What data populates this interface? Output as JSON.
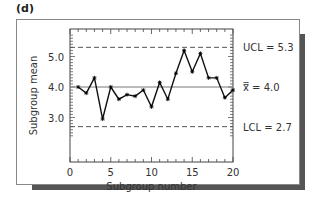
{
  "panel_label": "(d)",
  "chart_data": {
    "type": "line",
    "title": "",
    "xlabel": "Subgroup number",
    "ylabel": "Subgroup mean",
    "x": [
      1,
      2,
      3,
      4,
      5,
      6,
      7,
      8,
      9,
      10,
      11,
      12,
      13,
      14,
      15,
      16,
      17,
      18,
      19,
      20
    ],
    "series": [
      {
        "name": "Subgroup mean",
        "values": [
          4.0,
          3.8,
          4.3,
          2.95,
          4.0,
          3.6,
          3.75,
          3.7,
          3.9,
          3.35,
          4.15,
          3.6,
          4.45,
          5.2,
          4.5,
          5.1,
          4.3,
          4.3,
          3.65,
          3.9
        ]
      }
    ],
    "xlim": [
      0,
      20
    ],
    "ylim": [
      2.4,
      5.75
    ],
    "xticks": [
      0,
      5,
      10,
      15,
      20
    ],
    "xtick_labels": [
      "0",
      "5",
      "10",
      "15",
      "20"
    ],
    "yticks": [
      3.0,
      4.0,
      5.0
    ],
    "ytick_labels": [
      "3.0",
      "4.0",
      "5.0"
    ],
    "reference_lines": [
      {
        "name": "UCL",
        "value": 5.3,
        "label": "UCL = 5.3",
        "style": "dashed"
      },
      {
        "name": "center",
        "value": 4.0,
        "label": "x̿ = 4.0",
        "style": "solid"
      },
      {
        "name": "LCL",
        "value": 2.7,
        "label": "LCL = 2.7",
        "style": "dashed"
      }
    ],
    "grid": false,
    "legend": "none",
    "colors": {
      "line": "#111111",
      "center": "#777777",
      "limits": "#555555"
    }
  }
}
